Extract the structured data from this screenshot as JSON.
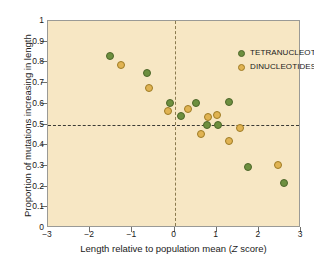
{
  "chart_data": {
    "type": "scatter",
    "title": "",
    "xlabel": "Length relative to population mean (Z score)",
    "ylabel": "Proportion of mutations increasing in length",
    "xlim": [
      -3,
      3
    ],
    "ylim": [
      0,
      1
    ],
    "xticks": [
      "-3",
      "-2",
      "-1",
      "0",
      "1",
      "2",
      "3"
    ],
    "xtick_values": [
      -3,
      -2,
      -1,
      0,
      1,
      2,
      3
    ],
    "yticks": [
      "0",
      "0.1",
      "0.2",
      "0.3",
      "0.4",
      "0.5",
      "0.6",
      "0.7",
      "0.8",
      "0.9",
      "1"
    ],
    "ytick_values": [
      0,
      0.1,
      0.2,
      0.3,
      0.4,
      0.5,
      0.6,
      0.7,
      0.8,
      0.9,
      1
    ],
    "grid": false,
    "legend_position": "top-right",
    "reference_lines": [
      {
        "name": "horizontal-half",
        "axis": "y",
        "value": 0.5,
        "style": "dashed",
        "color": "#3b3b36"
      },
      {
        "name": "vertical-zero",
        "axis": "x",
        "value": 0,
        "style": "dashed",
        "color": "#8a7a4e"
      }
    ],
    "series": [
      {
        "name": "TETRANUCLEOTIDES",
        "key": "tetra",
        "color": "#6d8f3f",
        "edge_color": "#4d6629",
        "points": [
          {
            "x": -1.52,
            "y": 0.83
          },
          {
            "x": -0.66,
            "y": 0.75
          },
          {
            "x": -0.1,
            "y": 0.605
          },
          {
            "x": 0.16,
            "y": 0.54
          },
          {
            "x": 0.5,
            "y": 0.605
          },
          {
            "x": 0.77,
            "y": 0.5
          },
          {
            "x": 1.02,
            "y": 0.5
          },
          {
            "x": 1.29,
            "y": 0.61
          },
          {
            "x": 1.75,
            "y": 0.295
          },
          {
            "x": 2.6,
            "y": 0.218
          }
        ]
      },
      {
        "name": "DINUCLEOTIDES",
        "key": "di",
        "color": "#e0b352",
        "edge_color": "#9e7b25",
        "points": [
          {
            "x": -1.27,
            "y": 0.787
          },
          {
            "x": -0.61,
            "y": 0.675
          },
          {
            "x": -0.16,
            "y": 0.565
          },
          {
            "x": 0.33,
            "y": 0.575
          },
          {
            "x": 0.64,
            "y": 0.455
          },
          {
            "x": 0.79,
            "y": 0.535
          },
          {
            "x": 1.0,
            "y": 0.545
          },
          {
            "x": 1.3,
            "y": 0.422
          },
          {
            "x": 1.56,
            "y": 0.485
          },
          {
            "x": 2.45,
            "y": 0.303
          }
        ]
      }
    ]
  },
  "axis": {
    "x_title_main": "Length relative to population mean (",
    "x_title_italic": "Z",
    "x_title_tail": " score)",
    "y_title": "Proportion of mutations increasing in length"
  },
  "legend": {
    "items": [
      {
        "label": "TETRANUCLEOTIDES",
        "key": "tetra"
      },
      {
        "label": "DINUCLEOTIDES",
        "key": "di"
      }
    ]
  },
  "colors": {
    "plot_background": "#f7e7c4",
    "page_background": "#ffffff",
    "frame_border": "#9a9a96",
    "tetra": "#6d8f3f",
    "di": "#e0b352",
    "text": "#1a1a1a"
  }
}
